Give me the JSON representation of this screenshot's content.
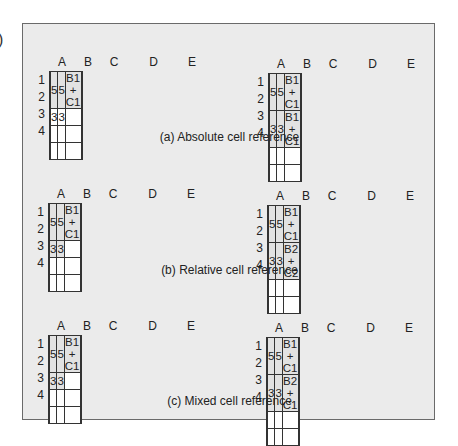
{
  "stray_glyph": ")",
  "colors": {
    "panel_bg": "#ebebeb",
    "cell_bg": "#ffffff",
    "shaded_cell_bg": "#e2e2e2",
    "grid_line": "#333333"
  },
  "columns": [
    "A",
    "B",
    "C",
    "D",
    "E"
  ],
  "rows": [
    "1",
    "2",
    "3",
    "4"
  ],
  "sections": [
    {
      "caption": "(a) Absolute cell reference",
      "left": {
        "cells": [
          [
            "",
            "5",
            "5",
            "B1 + C1",
            ""
          ],
          [
            "",
            "3",
            "3",
            "",
            ""
          ],
          [
            "",
            "",
            "",
            "",
            ""
          ],
          [
            "",
            "",
            "",
            "",
            ""
          ]
        ],
        "shaded": [
          [
            1,
            2,
            3
          ],
          []
        ]
      },
      "right": {
        "cells": [
          [
            "",
            "5",
            "5",
            "B1 + C1",
            ""
          ],
          [
            "",
            "3",
            "3",
            "B1 + C1",
            ""
          ],
          [
            "",
            "",
            "",
            "",
            ""
          ],
          [
            "",
            "",
            "",
            "",
            ""
          ]
        ],
        "shaded": [
          [
            1,
            2,
            3
          ],
          [
            1,
            2,
            3
          ]
        ]
      }
    },
    {
      "caption": "(b) Relative cell reference",
      "left": {
        "cells": [
          [
            "",
            "5",
            "5",
            "B1 + C1",
            ""
          ],
          [
            "",
            "3",
            "3",
            "",
            ""
          ],
          [
            "",
            "",
            "",
            "",
            ""
          ],
          [
            "",
            "",
            "",
            "",
            ""
          ]
        ],
        "shaded": [
          [
            1,
            2,
            3
          ],
          [
            1,
            2
          ]
        ]
      },
      "right": {
        "cells": [
          [
            "",
            "5",
            "5",
            "B1 + C1",
            ""
          ],
          [
            "",
            "3",
            "3",
            "B2 + C2",
            ""
          ],
          [
            "",
            "",
            "",
            "",
            ""
          ],
          [
            "",
            "",
            "",
            "",
            ""
          ]
        ],
        "shaded": [
          [
            1,
            2,
            3
          ],
          [
            1,
            2,
            3
          ]
        ]
      }
    },
    {
      "caption": "(c) Mixed cell reference",
      "left": {
        "cells": [
          [
            "",
            "5",
            "5",
            "B1 + C1",
            ""
          ],
          [
            "",
            "3",
            "3",
            "",
            ""
          ],
          [
            "",
            "",
            "",
            "",
            ""
          ],
          [
            "",
            "",
            "",
            "",
            ""
          ]
        ],
        "shaded": [
          [
            1,
            2,
            3
          ],
          [
            1,
            2
          ]
        ]
      },
      "right": {
        "cells": [
          [
            "",
            "5",
            "5",
            "B1 + C1",
            ""
          ],
          [
            "",
            "3",
            "3",
            "B2 + C1",
            ""
          ],
          [
            "",
            "",
            "",
            "",
            ""
          ],
          [
            "",
            "",
            "",
            "",
            ""
          ]
        ],
        "shaded": [
          [
            1,
            2,
            3
          ],
          [
            1,
            2,
            3
          ]
        ]
      }
    }
  ]
}
